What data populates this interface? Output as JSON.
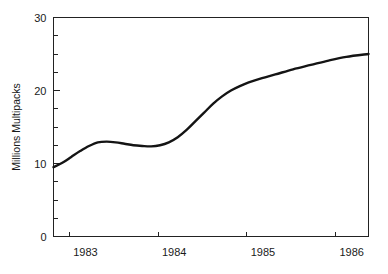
{
  "chart_data": {
    "type": "line",
    "title": "",
    "subtitle": "",
    "xlabel": "",
    "ylabel": "Millions Multipacks",
    "xlim": [
      1982.82,
      1986.37
    ],
    "ylim": [
      0,
      30
    ],
    "grid": false,
    "legend": null,
    "annotations": [],
    "y_ticks_major": [
      0,
      10,
      20,
      30
    ],
    "y_tick_labels": [
      "0",
      "10",
      "20",
      "30"
    ],
    "y_minor_step": 2.5,
    "x_ticks_major": [
      1983,
      1984,
      1985,
      1986
    ],
    "x_tick_labels": [
      "1983",
      "1984",
      "1985",
      "1986"
    ],
    "series": [
      {
        "name": "Millions Multipacks",
        "color": "#141414",
        "x": [
          1982.82,
          1982.92,
          1983.02,
          1983.12,
          1983.22,
          1983.32,
          1983.42,
          1983.52,
          1983.62,
          1983.72,
          1983.82,
          1983.92,
          1984.02,
          1984.12,
          1984.22,
          1984.32,
          1984.42,
          1984.52,
          1984.62,
          1984.72,
          1984.82,
          1984.92,
          1985.02,
          1985.17,
          1985.32,
          1985.52,
          1985.72,
          1985.92,
          1986.12,
          1986.37
        ],
        "y": [
          9.5,
          10.1,
          10.9,
          11.7,
          12.4,
          12.9,
          13.0,
          12.9,
          12.7,
          12.5,
          12.4,
          12.35,
          12.5,
          12.9,
          13.6,
          14.6,
          15.8,
          17.0,
          18.2,
          19.2,
          20.0,
          20.6,
          21.1,
          21.7,
          22.2,
          22.9,
          23.5,
          24.1,
          24.6,
          25.0
        ]
      }
    ]
  }
}
